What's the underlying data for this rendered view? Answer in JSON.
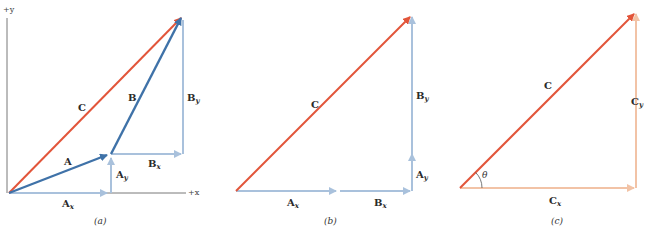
{
  "colors": {
    "resultant": "#e2553a",
    "vector": "#3f72a8",
    "component_blue": "#a9c1dc",
    "component_orange": "#f2c3a6",
    "axis": "#555555"
  },
  "panels": [
    {
      "caption": "(a)",
      "axis_labels": {
        "y": "+y",
        "x": "+x"
      },
      "labels": {
        "C": "C",
        "A": "A",
        "B": "B",
        "Ax": "A",
        "Ax_sub": "x",
        "Ay": "A",
        "Ay_sub": "y",
        "Bx": "B",
        "Bx_sub": "x",
        "By": "B",
        "By_sub": "y"
      }
    },
    {
      "caption": "(b)",
      "labels": {
        "C": "C",
        "Ax": "A",
        "Ax_sub": "x",
        "Bx": "B",
        "Bx_sub": "x",
        "Ay": "A",
        "Ay_sub": "y",
        "By": "B",
        "By_sub": "y"
      }
    },
    {
      "caption": "(c)",
      "labels": {
        "C": "C",
        "Cx": "C",
        "Cx_sub": "x",
        "Cy": "C",
        "Cy_sub": "y",
        "theta": "θ"
      }
    }
  ]
}
